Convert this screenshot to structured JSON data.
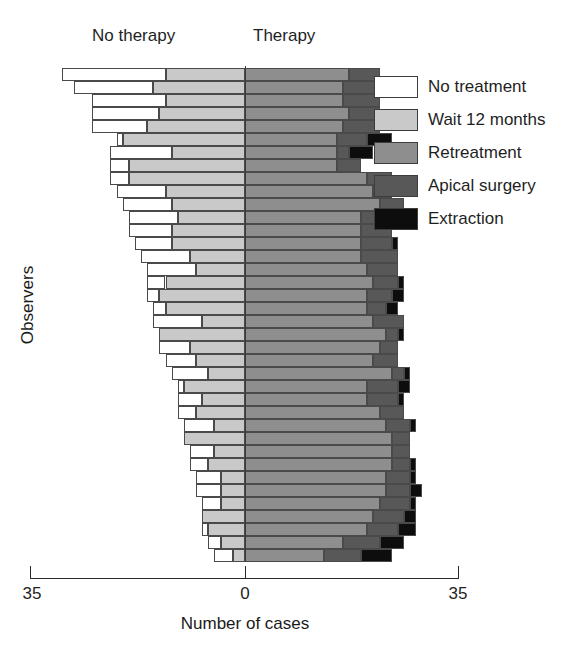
{
  "figure": {
    "left_group_label": "No therapy",
    "right_group_label": "Therapy",
    "y_axis_label": "Observers",
    "x_axis_label": "Number of cases",
    "x_tick_left": "35",
    "x_tick_center": "0",
    "x_tick_right": "35"
  },
  "legend": {
    "items": [
      {
        "label": "No treatment",
        "color": "#ffffff"
      },
      {
        "label": "Wait 12 months",
        "color": "#c9c9c9"
      },
      {
        "label": "Retreatment",
        "color": "#8e8e8e"
      },
      {
        "label": "Apical surgery",
        "color": "#585858"
      },
      {
        "label": "Extraction",
        "color": "#0d0d0d"
      }
    ]
  },
  "chart_data": {
    "type": "bar",
    "subtype": "diverging-stacked-bar",
    "orientation": "horizontal",
    "title": "",
    "xlabel": "Number of cases",
    "ylabel": "Observers",
    "xlim": [
      -35,
      35
    ],
    "x_ticks": [
      -35,
      0,
      35
    ],
    "x_tick_labels": [
      "35",
      "0",
      "35"
    ],
    "grid": false,
    "legend_position": "right",
    "group_left": "No therapy",
    "group_right": "Therapy",
    "categories_left": [
      "No treatment",
      "Wait 12 months"
    ],
    "categories_right": [
      "Retreatment",
      "Apical surgery",
      "Extraction"
    ],
    "colors": {
      "No treatment": "#ffffff",
      "Wait 12 months": "#c9c9c9",
      "Retreatment": "#8e8e8e",
      "Apical surgery": "#585858",
      "Extraction": "#0d0d0d"
    },
    "categories": [
      "Observer 1",
      "Observer 2",
      "Observer 3",
      "Observer 4",
      "Observer 5",
      "Observer 6",
      "Observer 7",
      "Observer 8",
      "Observer 9",
      "Observer 10",
      "Observer 11",
      "Observer 12",
      "Observer 13",
      "Observer 14",
      "Observer 15",
      "Observer 16",
      "Observer 17",
      "Observer 18",
      "Observer 19",
      "Observer 20",
      "Observer 21",
      "Observer 22",
      "Observer 23",
      "Observer 24",
      "Observer 25",
      "Observer 26",
      "Observer 27",
      "Observer 28",
      "Observer 29",
      "Observer 30",
      "Observer 31",
      "Observer 32",
      "Observer 33",
      "Observer 34",
      "Observer 35",
      "Observer 36",
      "Observer 37",
      "Observer 38"
    ],
    "series": [
      {
        "name": "No treatment",
        "side": "left",
        "values": [
          17,
          13,
          12,
          11,
          9,
          1,
          10,
          3,
          3,
          8,
          8,
          8,
          7,
          6,
          8,
          8,
          3,
          2,
          2,
          8,
          0,
          5,
          5,
          6,
          1,
          4,
          3,
          5,
          0,
          4,
          3,
          4,
          4,
          3,
          0,
          1,
          2,
          3
        ]
      },
      {
        "name": "Wait 12 months",
        "side": "left",
        "values": [
          13,
          15,
          13,
          14,
          16,
          20,
          12,
          19,
          19,
          13,
          12,
          11,
          12,
          12,
          9,
          8,
          13,
          14,
          13,
          7,
          14,
          9,
          8,
          6,
          10,
          7,
          8,
          5,
          10,
          5,
          6,
          4,
          4,
          4,
          7,
          6,
          4,
          2
        ]
      },
      {
        "name": "Retreatment",
        "side": "right",
        "values": [
          17,
          16,
          16,
          17,
          16,
          15,
          15,
          15,
          20,
          21,
          22,
          19,
          19,
          19,
          19,
          20,
          21,
          20,
          20,
          21,
          23,
          22,
          21,
          24,
          20,
          20,
          22,
          23,
          24,
          24,
          24,
          23,
          23,
          22,
          21,
          20,
          16,
          13
        ]
      },
      {
        "name": "Apical surgery",
        "side": "right",
        "values": [
          5,
          6,
          6,
          5,
          6,
          5,
          2,
          4,
          4,
          3,
          4,
          5,
          5,
          5,
          6,
          5,
          4,
          4,
          3,
          5,
          2,
          3,
          4,
          2,
          5,
          5,
          4,
          4,
          3,
          3,
          3,
          4,
          4,
          5,
          5,
          5,
          6,
          6
        ]
      },
      {
        "name": "Extraction",
        "side": "right",
        "values": [
          0,
          0,
          0,
          0,
          0,
          4,
          4,
          0,
          0,
          0,
          0,
          0,
          0,
          1,
          0,
          0,
          1,
          2,
          2,
          0,
          1,
          0,
          0,
          1,
          2,
          1,
          0,
          1,
          0,
          0,
          1,
          1,
          2,
          1,
          2,
          3,
          4,
          5
        ]
      }
    ]
  }
}
